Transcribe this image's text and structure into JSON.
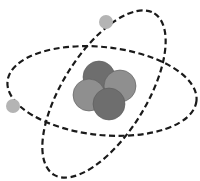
{
  "diagram": {
    "title": "Atom model",
    "subject": "atom",
    "colors": {
      "background": "#ffffff",
      "orbit_stroke": "#1a1a1a",
      "electron_fill": "#b4b4b4",
      "nucleus_dark": "#6e6e6e",
      "nucleus_light": "#8f8f8f",
      "nucleus_stroke": "#5a5a5a"
    },
    "orbits": [
      {
        "name": "orbit-horizontal",
        "cx": 102,
        "cy": 91,
        "rx": 95,
        "ry": 44,
        "rotate": 6
      },
      {
        "name": "orbit-diagonal",
        "cx": 104,
        "cy": 94,
        "rx": 95,
        "ry": 42,
        "rotate": -58
      }
    ],
    "electrons": [
      {
        "name": "electron-top",
        "cx": 106,
        "cy": 22,
        "r": 7
      },
      {
        "name": "electron-left",
        "cx": 13,
        "cy": 106,
        "r": 7
      }
    ],
    "nucleus": [
      {
        "name": "nucleon-top",
        "cx": 99,
        "cy": 77,
        "r": 16,
        "shade": "dark"
      },
      {
        "name": "nucleon-right",
        "cx": 120,
        "cy": 86,
        "r": 16,
        "shade": "light"
      },
      {
        "name": "nucleon-left",
        "cx": 89,
        "cy": 95,
        "r": 16,
        "shade": "light"
      },
      {
        "name": "nucleon-bottom",
        "cx": 109,
        "cy": 104,
        "r": 16,
        "shade": "dark"
      }
    ]
  }
}
